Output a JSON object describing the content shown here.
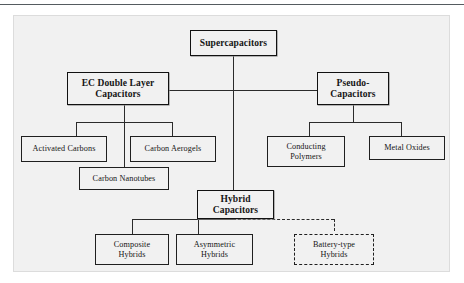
{
  "figure": {
    "type": "tree-diagram",
    "background_color": "#f1f1f1",
    "line_color": "#2b2b2b"
  },
  "nodes": {
    "root": {
      "label": "Supercapacitors",
      "style": "bold-solid"
    },
    "edl": {
      "label": "EC Double Layer\nCapacitors",
      "style": "bold-solid"
    },
    "pseudo": {
      "label": "Pseudo-\nCapacitors",
      "style": "bold-solid"
    },
    "hybrid": {
      "label": "Hybrid\nCapacitors",
      "style": "bold-solid"
    },
    "activated_carbons": {
      "label": "Activated Carbons",
      "style": "solid"
    },
    "carbon_aerogels": {
      "label": "Carbon Aerogels",
      "style": "solid"
    },
    "carbon_nanotubes": {
      "label": "Carbon Nanotubes",
      "style": "solid"
    },
    "conducting_polymers": {
      "label": "Conducting\nPolymers",
      "style": "solid"
    },
    "metal_oxides": {
      "label": "Metal Oxides",
      "style": "solid"
    },
    "composite_hybrids": {
      "label": "Composite\nHybrids",
      "style": "solid"
    },
    "asymmetric_hybrids": {
      "label": "Asymmetric\nHybrids",
      "style": "solid"
    },
    "battery_type_hybrids": {
      "label": "Battery-type\nHybrids",
      "style": "dashed"
    }
  }
}
